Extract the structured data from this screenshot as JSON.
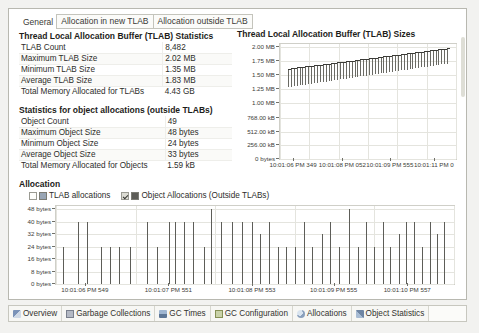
{
  "tabs": [
    {
      "label": "General",
      "active": true
    },
    {
      "label": "Allocation in new TLAB",
      "active": false
    },
    {
      "label": "Allocation outside TLAB",
      "active": false
    }
  ],
  "tlab_section": {
    "title": "Thread Local Allocation Buffer (TLAB) Statistics",
    "rows": [
      {
        "key": "TLAB Count",
        "value": "8,482"
      },
      {
        "key": "Maximum TLAB Size",
        "value": "2.02 MB"
      },
      {
        "key": "Minimum TLAB Size",
        "value": "1.35 MB"
      },
      {
        "key": "Average TLAB Size",
        "value": "1.83 MB"
      },
      {
        "key": "Total Memory Allocated for TLABs",
        "value": "4.43 GB"
      }
    ]
  },
  "object_section": {
    "title": "Statistics for object allocations (outside TLABs)",
    "rows": [
      {
        "key": "Object Count",
        "value": "49"
      },
      {
        "key": "Maximum Object Size",
        "value": "48 bytes"
      },
      {
        "key": "Minimum Object Size",
        "value": "24 bytes"
      },
      {
        "key": "Average Object Size",
        "value": "33 bytes"
      },
      {
        "key": "Total Memory Allocated for Objects",
        "value": "1.59 kB"
      }
    ]
  },
  "allocation_section": {
    "title": "Allocation",
    "legend": [
      {
        "label": "TLAB allocations",
        "checked": false,
        "color": "#9aa6b5"
      },
      {
        "label": "Object Allocations (Outside TLABs)",
        "checked": true,
        "color": "#5d5d58"
      }
    ]
  },
  "bottom_tabs": [
    {
      "label": "Overview",
      "icon": "overview-icon"
    },
    {
      "label": "Garbage Collections",
      "icon": "garbage-collections-icon"
    },
    {
      "label": "GC Times",
      "icon": "gc-times-icon"
    },
    {
      "label": "GC Configuration",
      "icon": "gc-configuration-icon"
    },
    {
      "label": "Allocations",
      "icon": "allocations-icon"
    },
    {
      "label": "Object Statistics",
      "icon": "object-statistics-icon"
    }
  ],
  "chart_data": [
    {
      "id": "tlab_sizes",
      "type": "bar",
      "title": "Thread Local Allocation Buffer (TLAB) Sizes",
      "xlabel": "",
      "ylabel": "",
      "ylim": [
        0,
        2150000
      ],
      "ytick_values": [
        0,
        256000,
        512000,
        768000,
        1048576,
        1310720,
        1572864,
        1835008,
        2097152
      ],
      "ytick_labels": [
        "0 bytes",
        "256.00 kB",
        "512.00 kB",
        "768.00 kB",
        "1.00 MB",
        "1.25 MB",
        "1.50 MB",
        "1.75 MB",
        "2.00 MB"
      ],
      "xtick_labels": [
        "10:01:06 PM 349",
        "10:01:08 PM 052",
        "10:01:09 PM 555",
        "10:01:11 PM 0"
      ],
      "xtick_positions": [
        0.08,
        0.36,
        0.63,
        0.88
      ],
      "grid": true,
      "series": [
        {
          "name": "TLAB size",
          "bar_top_values": [
            1690000,
            1700000,
            1705000,
            1712000,
            1718000,
            1724000,
            1730000,
            1737000,
            1743000,
            1750000,
            1757000,
            1764000,
            1771000,
            1778000,
            1785000,
            1792000,
            1799000,
            1806000,
            1813000,
            1820000,
            1827000,
            1834000,
            1841000,
            1848000,
            1855000,
            1862000,
            1869000,
            1876000,
            1883000,
            1890000,
            1897000,
            1904000,
            1911000,
            1918000,
            1925000,
            1932000,
            1939000,
            1946000,
            1953000,
            1960000,
            1967000,
            1974000,
            1981000,
            1988000,
            1995000,
            2002000,
            2009000,
            2016000,
            2023000,
            2030000,
            2037000,
            2044000,
            2051000,
            2058000,
            2065000,
            2072000
          ],
          "bar_bottom_values": [
            1340000,
            1352000,
            1360000,
            1368000,
            1376000,
            1384000,
            1392000,
            1400000,
            1408000,
            1416000,
            1424000,
            1432000,
            1440000,
            1448000,
            1456000,
            1464000,
            1472000,
            1480000,
            1488000,
            1496000,
            1504000,
            1512000,
            1520000,
            1528000,
            1536000,
            1544000,
            1552000,
            1560000,
            1568000,
            1576000,
            1584000,
            1592000,
            1600000,
            1608000,
            1616000,
            1624000,
            1632000,
            1640000,
            1648000,
            1656000,
            1664000,
            1672000,
            1680000,
            1688000,
            1696000,
            1704000,
            1712000,
            1720000,
            1728000,
            1736000,
            1744000,
            1752000,
            1760000,
            1768000,
            1776000,
            1784000
          ]
        }
      ]
    },
    {
      "id": "object_allocations",
      "type": "bar",
      "title": "Allocation",
      "xlabel": "",
      "ylabel": "",
      "ylim": [
        0,
        50
      ],
      "ytick_values": [
        0,
        8,
        16,
        24,
        32,
        40,
        48
      ],
      "ytick_labels": [
        "0 bytes",
        "8 bytes",
        "16 bytes",
        "24 bytes",
        "32 bytes",
        "40 bytes",
        "48 bytes"
      ],
      "xtick_labels": [
        "10:01:06 PM 549",
        "10:01:07 PM 551",
        "10:01:08 PM 553",
        "10:01:09 PM 555",
        "10:01:10 PM 557"
      ],
      "xtick_positions": [
        0.075,
        0.285,
        0.495,
        0.7,
        0.885
      ],
      "grid": true,
      "series": [
        {
          "name": "Object Allocations (Outside TLABs)",
          "x_positions": [
            0.018,
            0.055,
            0.078,
            0.112,
            0.135,
            0.158,
            0.185,
            0.228,
            0.253,
            0.283,
            0.3,
            0.322,
            0.345,
            0.372,
            0.39,
            0.415,
            0.443,
            0.468,
            0.492,
            0.512,
            0.535,
            0.557,
            0.578,
            0.6,
            0.622,
            0.643,
            0.668,
            0.688,
            0.71,
            0.735,
            0.758,
            0.78,
            0.8,
            0.822,
            0.84,
            0.862,
            0.88,
            0.9,
            0.92,
            0.94,
            0.958,
            0.975
          ],
          "values": [
            24,
            40,
            40,
            24,
            24,
            24,
            24,
            40,
            24,
            40,
            40,
            40,
            40,
            24,
            48,
            40,
            40,
            40,
            40,
            32,
            40,
            24,
            24,
            24,
            40,
            24,
            32,
            40,
            24,
            48,
            24,
            40,
            24,
            40,
            24,
            32,
            40,
            40,
            24,
            40,
            32,
            40
          ]
        }
      ]
    }
  ]
}
